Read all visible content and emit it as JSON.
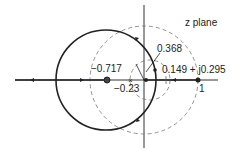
{
  "diagram": {
    "title": "z plane",
    "labels": {
      "zero": "−0.717",
      "breakaway": "−0.23",
      "pole_inner": "0.368",
      "crossing": "0.149 + j0.295",
      "unit": "1"
    },
    "colors": {
      "locus": "#222222",
      "dashed": "#777777",
      "axes": "#333333"
    }
  }
}
